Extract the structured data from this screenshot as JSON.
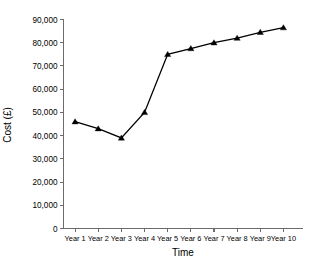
{
  "chart_data": {
    "type": "line",
    "title": "",
    "subtitle": "",
    "xlabel": "Time",
    "ylabel": "Cost (£)",
    "categories": [
      "Year 1",
      "Year 2",
      "Year 3",
      "Year 4",
      "Year 5",
      "Year 6",
      "Year 7",
      "Year 8",
      "Year 9",
      "Year 10"
    ],
    "values": [
      46000,
      43000,
      39000,
      50000,
      75000,
      77500,
      80000,
      82000,
      84500,
      86500
    ],
    "series": [
      {
        "name": "Cost",
        "values": [
          46000,
          43000,
          39000,
          50000,
          75000,
          77500,
          80000,
          82000,
          84500,
          86500
        ]
      }
    ],
    "ylim": [
      0,
      90000
    ],
    "ytick_values": [
      0,
      10000,
      20000,
      30000,
      40000,
      50000,
      60000,
      70000,
      80000,
      90000
    ],
    "ytick_labels": [
      "0",
      "10,000",
      "20,000",
      "30,000",
      "40,000",
      "50,000",
      "60,000",
      "70,000",
      "80,000",
      "90,000"
    ],
    "xtick_labels": [
      "Year 1",
      "Year 2",
      "Year 3",
      "Year 4",
      "Year 5",
      "Year 6",
      "Year 7",
      "Year 8",
      "Year 9",
      "Year 10"
    ],
    "grid": false,
    "legend": false,
    "legend_position": "none",
    "marker": "triangle",
    "line_color": "#000000",
    "marker_color": "#000000",
    "axis_color": "#6b6b6b",
    "background_color": "#ffffff"
  },
  "axis_titles": {
    "x": "Time",
    "y": "Cost (£)"
  }
}
